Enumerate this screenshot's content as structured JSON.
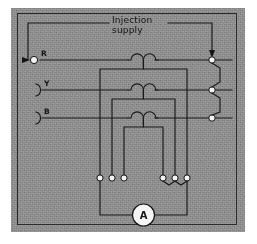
{
  "figure": {
    "kind": "electrical-schematic",
    "background_color": "#8c8c8c",
    "line_color": "#191919",
    "terminal_fill": "#f2f2f2",
    "page_background": "#ffffff"
  },
  "labels": {
    "supply_line1": "Injection",
    "supply_line2": "supply",
    "phase_r": "R",
    "phase_y": "Y",
    "phase_b": "B",
    "ammeter": "A"
  },
  "components": {
    "supply_label_name": "injection-supply-label",
    "ammeter_name": "ammeter",
    "ct_count": 3,
    "left_terminal_count": 3,
    "right_terminal_count": 3,
    "bottom_terminal_count": 6
  }
}
